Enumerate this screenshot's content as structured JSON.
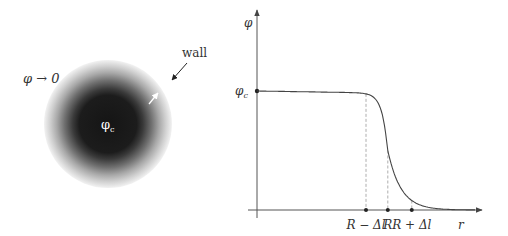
{
  "left_panel": {
    "outside_label": "φ → 0",
    "wall_label": "wall",
    "core_label": "φ",
    "core_subscript": "c",
    "colors": {
      "core": "#1a1a1a",
      "halo": "#bdbdbd",
      "core_text": "#ffffff",
      "arrow": "#222222"
    }
  },
  "right_panel": {
    "y_axis_label": "φ",
    "x_axis_label": "r",
    "phi_c_label": "φ",
    "phi_c_subscript": "c",
    "x_tick_labels": [
      "R − Δl",
      "R",
      "R + Δl"
    ],
    "colors": {
      "axis": "#555555",
      "curve": "#444444",
      "dashed": "#999999"
    }
  },
  "chart_data": {
    "type": "line",
    "title": "",
    "xlabel": "r",
    "ylabel": "φ",
    "x_ticks": [
      {
        "label": "R − Δl",
        "value": 0.5
      },
      {
        "label": "R",
        "value": 0.6
      },
      {
        "label": "R + Δl",
        "value": 0.71
      }
    ],
    "y_ticks": [
      {
        "label": "φc",
        "value": 1.0
      }
    ],
    "xlim": [
      0,
      1
    ],
    "ylim": [
      0,
      1.5
    ],
    "grid": false,
    "legend": "none",
    "series": [
      {
        "name": "φ(r)",
        "x": [
          0.0,
          0.2,
          0.4,
          0.5,
          0.55,
          0.58,
          0.6,
          0.62,
          0.66,
          0.71,
          0.8,
          0.9,
          1.0
        ],
        "y": [
          1.0,
          0.995,
          0.985,
          0.97,
          0.92,
          0.8,
          0.5,
          0.3,
          0.15,
          0.08,
          0.03,
          0.01,
          0.0
        ]
      }
    ]
  }
}
